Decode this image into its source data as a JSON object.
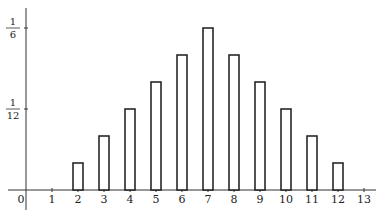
{
  "chart_data": {
    "type": "bar",
    "title": "",
    "xlabel": "",
    "ylabel": "",
    "categories": [
      "2",
      "3",
      "4",
      "5",
      "6",
      "7",
      "8",
      "9",
      "10",
      "11",
      "12"
    ],
    "values": [
      0.02778,
      0.05556,
      0.08333,
      0.11111,
      0.13889,
      0.16667,
      0.13889,
      0.11111,
      0.08333,
      0.05556,
      0.02778
    ],
    "values_fraction": [
      "1/36",
      "2/36",
      "3/36",
      "4/36",
      "5/36",
      "6/36",
      "5/36",
      "4/36",
      "3/36",
      "2/36",
      "1/36"
    ],
    "x_ticks": [
      "0",
      "1",
      "2",
      "3",
      "4",
      "5",
      "6",
      "7",
      "8",
      "9",
      "10",
      "11",
      "12",
      "13"
    ],
    "y_ticks": [
      {
        "value": 0.08333,
        "numerator": "1",
        "denominator": "12"
      },
      {
        "value": 0.16667,
        "numerator": "1",
        "denominator": "6"
      }
    ],
    "xlim": [
      0,
      13
    ],
    "ylim": [
      0,
      0.18
    ],
    "grid": false,
    "legend": null,
    "bar_fill": "#ffffff",
    "bar_stroke": "#1a1a1a"
  }
}
